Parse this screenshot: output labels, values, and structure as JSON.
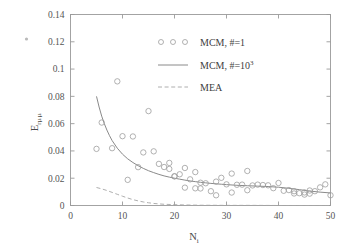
{
  "figure": {
    "background": "#ffffff",
    "line_color": "#8a8a8a",
    "marker_color": "#9d9d9d",
    "axis_color": "#9a9a9a",
    "text_color": "#4a4a4a"
  },
  "axes": {
    "x_title_base": "N",
    "x_title_sub": "i",
    "y_title_base": "E",
    "y_title_sub1": "r",
    "y_title_sub2": "μᵢμᵢ",
    "x_ticks": [
      "0",
      "10",
      "20",
      "30",
      "40",
      "50"
    ],
    "y_ticks": [
      "0",
      "0.02",
      "0.04",
      "0.06",
      "0.08",
      "0.1",
      "0.12",
      "0.14"
    ]
  },
  "legend": {
    "items": [
      {
        "label_main": "MCM, #=1",
        "label_sup": "",
        "marker": "circles"
      },
      {
        "label_main": "MCM, #=10",
        "label_sup": "3",
        "marker": "solid-line"
      },
      {
        "label_main": "MEA",
        "label_sup": "",
        "marker": "dashed-line"
      }
    ]
  },
  "chart_data": {
    "type": "scatter",
    "title": "",
    "xlabel": "N_i",
    "ylabel": "E_r(mu_i mu_i)",
    "xlim": [
      0,
      50
    ],
    "ylim": [
      0,
      0.14
    ],
    "xticks": [
      0,
      10,
      20,
      30,
      40,
      50
    ],
    "yticks": [
      0,
      0.02,
      0.04,
      0.06,
      0.08,
      0.1,
      0.12,
      0.14
    ],
    "grid": false,
    "legend_position": "upper-center",
    "series": [
      {
        "name": "MCM, #=1",
        "type": "scatter",
        "marker": "circle-open",
        "x": [
          5,
          6,
          8,
          9,
          10,
          11,
          12,
          13,
          14,
          15,
          16,
          17,
          18,
          19,
          19,
          20,
          20,
          21,
          22,
          22,
          23,
          24,
          24,
          25,
          25,
          26,
          27,
          28,
          28,
          29,
          30,
          31,
          31,
          32,
          33,
          34,
          34,
          35,
          36,
          37,
          38,
          39,
          40,
          41,
          42,
          43,
          43,
          44,
          45,
          45,
          46,
          46,
          47,
          48,
          49,
          50
        ],
        "y": [
          0.0415,
          0.0608,
          0.042,
          0.091,
          0.0508,
          0.0188,
          0.0506,
          0.0281,
          0.0389,
          0.0692,
          0.0397,
          0.0305,
          0.0282,
          0.0312,
          0.0268,
          0.0215,
          0.0213,
          0.0229,
          0.0131,
          0.0275,
          0.0192,
          0.0245,
          0.0126,
          0.0167,
          0.0125,
          0.0163,
          0.0105,
          0.0175,
          0.0075,
          0.0203,
          0.0155,
          0.0234,
          0.0095,
          0.0152,
          0.0153,
          0.0253,
          0.0112,
          0.0147,
          0.0153,
          0.015,
          0.0148,
          0.0127,
          0.0165,
          0.0108,
          0.0113,
          0.0088,
          0.0105,
          0.009,
          0.0096,
          0.008,
          0.011,
          0.0087,
          0.0105,
          0.0133,
          0.0155,
          0.0075
        ]
      },
      {
        "name": "MCM, #=10^3",
        "type": "line",
        "style": "solid",
        "x": [
          5,
          5.5,
          6,
          6.5,
          7,
          7.5,
          8,
          9,
          10,
          11,
          12,
          13,
          14,
          15,
          16,
          17,
          18,
          19,
          20,
          21,
          22,
          23,
          24,
          25,
          26,
          27,
          28,
          29,
          30,
          32,
          34,
          36,
          38,
          40,
          42,
          44,
          46,
          48,
          50
        ],
        "y": [
          0.08,
          0.0722,
          0.0655,
          0.06,
          0.0553,
          0.0512,
          0.0476,
          0.042,
          0.0376,
          0.0342,
          0.0315,
          0.0292,
          0.0272,
          0.0255,
          0.0241,
          0.0228,
          0.0217,
          0.0208,
          0.02,
          0.0193,
          0.0186,
          0.018,
          0.0175,
          0.017,
          0.0166,
          0.0162,
          0.0159,
          0.0156,
          0.0153,
          0.0148,
          0.0145,
          0.0142,
          0.0139,
          0.0134,
          0.0126,
          0.0116,
          0.0106,
          0.0098,
          0.0092
        ]
      },
      {
        "name": "MEA",
        "type": "line",
        "style": "dashed",
        "x": [
          5,
          6,
          7,
          8,
          9,
          10,
          11,
          12,
          13,
          14,
          15,
          16,
          17,
          18,
          20,
          22,
          25,
          30,
          35,
          40,
          45,
          50
        ],
        "y": [
          0.0132,
          0.0122,
          0.011,
          0.0096,
          0.0082,
          0.0068,
          0.0055,
          0.0043,
          0.0034,
          0.0026,
          0.002,
          0.0015,
          0.0012,
          0.0009,
          0.0006,
          0.0004,
          0.0002,
          0.0001,
          0.0001,
          0.0,
          0.0,
          0.0
        ]
      }
    ]
  }
}
